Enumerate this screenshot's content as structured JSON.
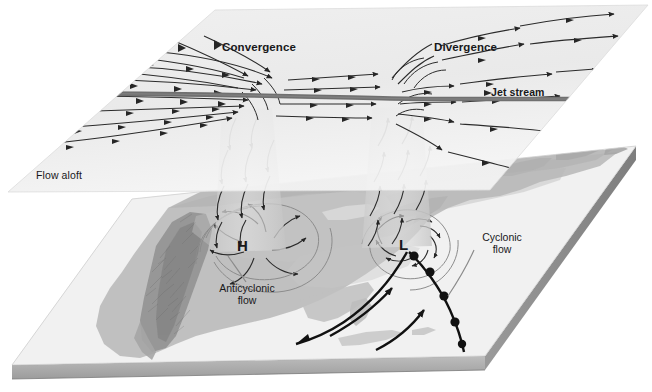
{
  "figure": {
    "type": "meteorological-diagram"
  },
  "upper_plane": {
    "name": "flow-aloft-plane",
    "label": "Flow aloft",
    "fill": "#ededed",
    "labels": {
      "convergence": "Convergence",
      "divergence": "Divergence",
      "jet_stream": "Jet stream"
    }
  },
  "surface_plane": {
    "name": "surface-map-plane",
    "fill": "#e9e9e9",
    "slab_color": "#9a9a9a",
    "labels": {
      "high": "H",
      "low": "L",
      "anticyclonic": "Anticyclonic\nflow",
      "cyclonic": "Cyclonic\nflow"
    }
  },
  "colors": {
    "jet_arrow": "#6f6f6f",
    "stream_arrow": "#2b2b2b",
    "front_line": "#111111",
    "land": "#b9b9b9",
    "mountain": "#8e8e8e",
    "water": "#f2f2f2",
    "plane_light": "#f0f0f0",
    "plane_mid": "#dedede",
    "slab_front": "#a8a8a8",
    "slab_side": "#8a8a8a",
    "column": "#cfcfcf"
  },
  "annotations": [
    {
      "name": "convergence-label",
      "text": "Convergence",
      "x": 222,
      "y": 41
    },
    {
      "name": "divergence-label",
      "text": "Divergence",
      "x": 434,
      "y": 41
    },
    {
      "name": "jet-stream-label",
      "text": "Jet stream",
      "x": 491,
      "y": 87
    },
    {
      "name": "flow-aloft-label",
      "text": "Flow aloft",
      "x": 36,
      "y": 170
    },
    {
      "name": "high-pressure-label",
      "text": "H",
      "x": 237,
      "y": 238
    },
    {
      "name": "low-pressure-label",
      "text": "L",
      "x": 399,
      "y": 237
    },
    {
      "name": "anticyclonic-flow-label",
      "text": "Anticyclonic flow",
      "x": 206,
      "y": 283
    },
    {
      "name": "cyclonic-flow-label",
      "text": "Cyclonic flow",
      "x": 474,
      "y": 232
    }
  ]
}
